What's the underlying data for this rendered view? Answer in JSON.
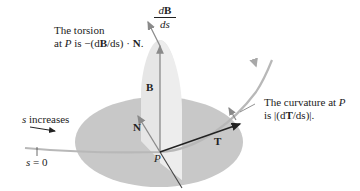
{
  "figure": {
    "type": "frenet-frame-diagram",
    "colors": {
      "plane_fill": "#c8c8c8",
      "osculating_plane_fill": "#e4e4e4",
      "curve": "#b5b5b5",
      "vector_dark": "#222222",
      "vector_gray": "#8a8a8a",
      "text": "#222222"
    },
    "point": {
      "label": "P"
    },
    "vectors": {
      "T": {
        "label": "T"
      },
      "N": {
        "label": "N"
      },
      "B": {
        "label": "B"
      },
      "dB_ds": {
        "numerator": "dB",
        "denominator": "ds"
      }
    },
    "annotations": {
      "torsion_line1": "The torsion",
      "torsion_line2_prefix": "at ",
      "torsion_P": "P",
      "torsion_line2_mid": " is −(d",
      "torsion_B": "B",
      "torsion_line2_mid2": "/ds) · ",
      "torsion_N": "N",
      "torsion_end": ".",
      "curvature_line1_prefix": "The curvature at ",
      "curvature_P": "P",
      "curvature_line2_prefix": "is |(d",
      "curvature_T": "T",
      "curvature_line2_end": "/ds)|.",
      "s_increases": "increases",
      "s_var": "s",
      "s_zero": "= 0"
    }
  }
}
